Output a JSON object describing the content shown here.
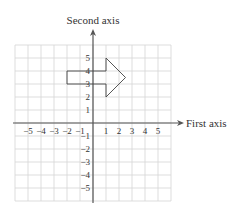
{
  "diagram": {
    "type": "coordinate-grid",
    "x_axis": {
      "label": "First axis",
      "range": [
        -6,
        6
      ],
      "tick_labels": [
        "−5",
        "−4",
        "−3",
        "−2",
        "−1",
        "1",
        "2",
        "3",
        "4",
        "5"
      ],
      "tick_values": [
        -5,
        -4,
        -3,
        -2,
        -1,
        1,
        2,
        3,
        4,
        5
      ]
    },
    "y_axis": {
      "label": "Second axis",
      "range": [
        -6,
        6
      ],
      "tick_labels": [
        "5",
        "4",
        "3",
        "2",
        "1",
        "−1",
        "−2",
        "−3",
        "−4",
        "−5"
      ],
      "tick_values": [
        5,
        4,
        3,
        2,
        1,
        -1,
        -2,
        -3,
        -4,
        -5
      ]
    },
    "grid": true,
    "shape": {
      "name": "arrow",
      "vertices": [
        [
          -2,
          4
        ],
        [
          1,
          4
        ],
        [
          1,
          5
        ],
        [
          2.5,
          3.5
        ],
        [
          1,
          2
        ],
        [
          1,
          3
        ],
        [
          -2,
          3
        ]
      ]
    },
    "colors": {
      "grid": "#d4d4d4",
      "axis": "#555555",
      "shape": "#444444",
      "text": "#333333"
    }
  }
}
